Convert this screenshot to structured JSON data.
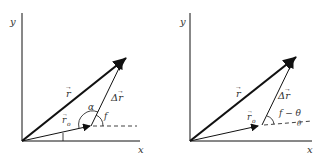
{
  "diagrams": [
    {
      "id": "left",
      "axis_labels": {
        "x": "x",
        "y": "y"
      },
      "vectors": {
        "r": "r",
        "r0": "r",
        "r0_subscript": "o",
        "delta_r": "Δr"
      },
      "angles": {
        "alpha": "α",
        "phi": "f"
      }
    },
    {
      "id": "right",
      "axis_labels": {
        "x": "x",
        "y": "y"
      },
      "vectors": {
        "r": "r",
        "r0": "r",
        "r0_subscript": "o",
        "delta_r": "Δr"
      },
      "angles": {
        "phi_minus_theta": "f − θ",
        "theta_small": "θ"
      }
    }
  ],
  "colors": {
    "stroke": "#111111",
    "text": "#333333",
    "background": "#ffffff"
  }
}
